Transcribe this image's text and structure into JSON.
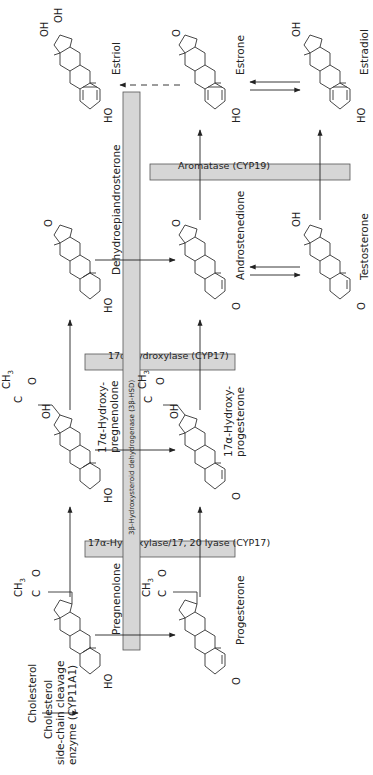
{
  "orientation": "rotated-90-ccw",
  "precursor": {
    "name": "Cholesterol",
    "enzyme_lines": [
      "Cholesterol",
      "side-chain cleavage",
      "enzyme (CYP11A1)"
    ]
  },
  "compounds": {
    "pregnenolone": "Pregnenolone",
    "hydroxypregnenolone_1": "17α-Hydroxy-",
    "hydroxypregnenolone_2": "pregnenolone",
    "dhea": "Dehydroepiandrosterone",
    "estriol": "Estriol",
    "progesterone": "Progesterone",
    "hydroxyprogesterone_1": "17α-Hydroxy-",
    "hydroxyprogesterone_2": "progesterone",
    "androstenedione": "Androstenedione",
    "estrone": "Estrone",
    "testosterone": "Testosterone",
    "estradiol": "Estradiol"
  },
  "enzymes": {
    "cyp17_lyase": "17α-Hydroxylase/17, 20 lyase (CYP17)",
    "cyp17_hydroxylase": "17α-Hydroxylase (CYP17)",
    "hsd3b": "3β-Hydroxysteroid dehydrogenase (3β-HSD)",
    "aromatase": "Aromatase (CYP19)"
  },
  "atoms": {
    "ho": "HO",
    "oh": "OH",
    "o": "O",
    "c": "C",
    "ch3": "CH",
    "ch3_sub": "3"
  },
  "colors": {
    "enzyme_box": "#d6d6d6",
    "line": "#222222",
    "background": "#ffffff"
  }
}
